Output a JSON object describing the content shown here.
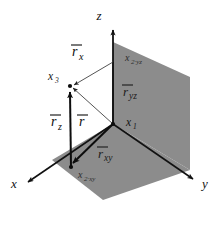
{
  "figure": {
    "background_color": "#ffffff",
    "plane_fill_color": "#8c8c8c",
    "floor_fill_color": "#8c8c8c",
    "line_color": "#111111"
  },
  "axes": [
    {
      "id": "x",
      "label": "x",
      "label_x": 14,
      "label_y": 188
    },
    {
      "id": "y",
      "label": "y",
      "label_x": 203,
      "label_y": 188
    },
    {
      "id": "z",
      "label": "z",
      "label_x": 99,
      "label_y": 19
    }
  ],
  "points": [
    {
      "id": "x1",
      "base": "x",
      "sub": "1",
      "label_x": 128,
      "label_y": 126
    },
    {
      "id": "x3",
      "base": "x",
      "sub": "3",
      "label_x": 50,
      "label_y": 79
    },
    {
      "id": "x2_yz",
      "base": "x",
      "sub": "2·yz",
      "label_x": 127,
      "label_y": 61
    },
    {
      "id": "x2_xy",
      "base": "x",
      "sub": "2·xy",
      "label_x": 79,
      "label_y": 178
    }
  ],
  "vectors": [
    {
      "id": "r_x",
      "base": "r",
      "sub": "x",
      "label_x": 77,
      "label_y": 55
    },
    {
      "id": "r_yz",
      "base": "r",
      "sub": "yz",
      "label_x": 126,
      "label_y": 96
    },
    {
      "id": "r_z",
      "base": "r",
      "sub": "z",
      "label_x": 55,
      "label_y": 126
    },
    {
      "id": "r",
      "base": "r",
      "sub": "",
      "label_x": 81,
      "label_y": 126
    },
    {
      "id": "r_xy",
      "base": "r",
      "sub": "xy",
      "label_x": 100,
      "label_y": 158
    }
  ],
  "geometry": {
    "origin": {
      "x": 113,
      "y": 124
    },
    "yz_plane_polygon": "113,42 190,77 190,170 113,124",
    "xy_plane_polygon": "113,124 190,170 103,200 52,160",
    "z_axis": {
      "x1": 113,
      "y1": 124,
      "x2": 113,
      "y2": 28
    },
    "x_axis": {
      "x1": 113,
      "y1": 124,
      "x2": 25,
      "y2": 184
    },
    "y_axis": {
      "x1": 113,
      "y1": 124,
      "x2": 196,
      "y2": 181
    },
    "point_x1": {
      "x": 113,
      "y": 124
    },
    "point_x3": {
      "x": 70,
      "y": 86
    },
    "point_x2_yz": {
      "x": 113,
      "y": 62
    },
    "point_x2_xy": {
      "x": 71,
      "y": 167
    },
    "vector_r": {
      "x1": 113,
      "y1": 124,
      "x2": 70,
      "y2": 86
    },
    "vector_rz": {
      "x1": 71,
      "y1": 167,
      "x2": 70,
      "y2": 86
    },
    "vector_rxy": {
      "x1": 113,
      "y1": 124,
      "x2": 71,
      "y2": 167
    },
    "vector_rx": {
      "x1": 113,
      "y1": 62,
      "x2": 70,
      "y2": 86
    },
    "vector_ryz": {
      "x1": 113,
      "y1": 124,
      "x2": 113,
      "y2": 62
    }
  }
}
